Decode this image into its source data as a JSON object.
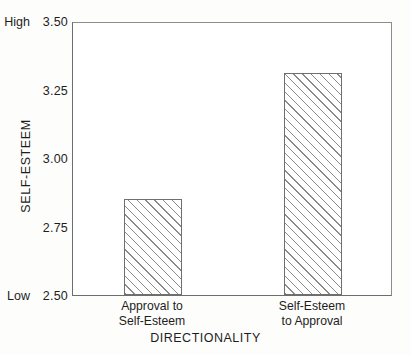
{
  "chart_data": {
    "type": "bar",
    "title": "",
    "subtitle": "",
    "xlabel": "DIRECTIONALITY",
    "ylabel": "SELF-ESTEEM",
    "categories": [
      "Approval to Self-Esteem",
      "Self-Esteem to Approval"
    ],
    "category_lines": [
      [
        "Approval to",
        "Self-Esteem"
      ],
      [
        "Self-Esteem",
        "to Approval"
      ]
    ],
    "values": [
      2.85,
      3.31
    ],
    "ylim": [
      2.5,
      3.5
    ],
    "yticks": [
      3.5,
      3.25,
      3.0,
      2.75,
      2.5
    ],
    "ytick_labels": [
      "3.50",
      "3.25",
      "3.00",
      "2.75",
      "2.50"
    ],
    "y_axis_anchors": [
      {
        "label": "High",
        "value": 3.5
      },
      {
        "label": "Low",
        "value": 2.5
      }
    ],
    "grid": false,
    "legend": null,
    "bar_fill": "diagonal-hatch",
    "colors": {
      "axis": "#6d6d6d",
      "bar_edge": "#6f6f6f",
      "hatch": "#8a8a8a",
      "bar_face": "#ffffff",
      "text": "#1d1d1d",
      "background": "#fdfdfc",
      "plot_background": "#ffffff"
    }
  }
}
